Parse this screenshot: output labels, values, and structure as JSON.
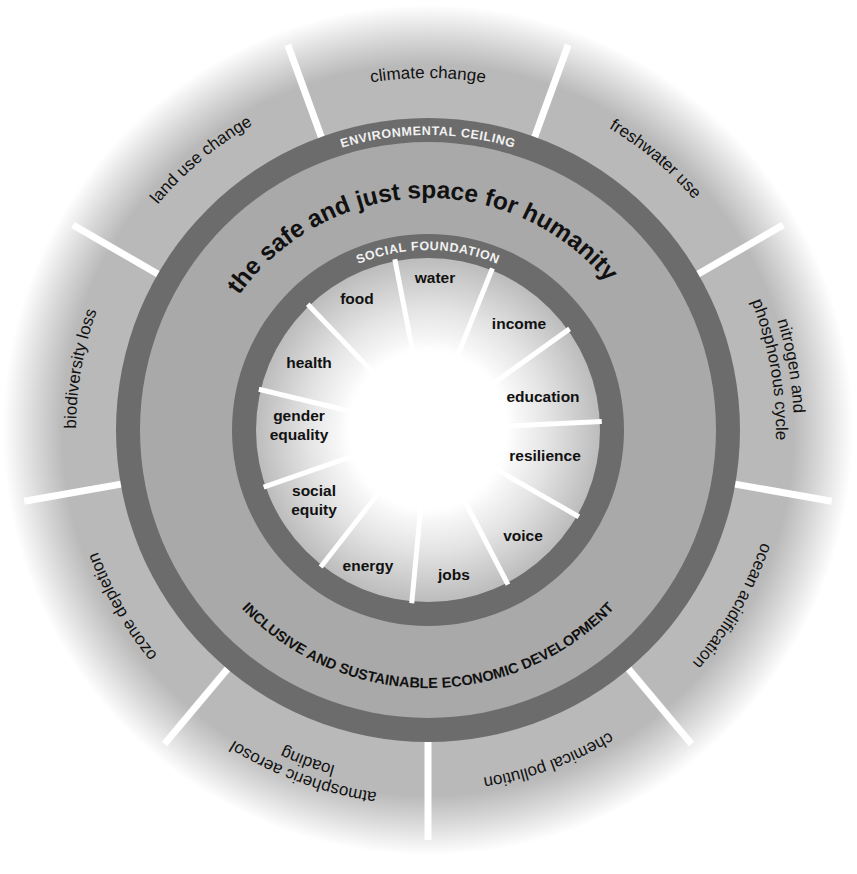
{
  "diagram": {
    "title": "the safe and just space for humanity",
    "environmental_ceiling_label": "ENVIRONMENTAL CEILING",
    "social_foundation_label": "SOCIAL FOUNDATION",
    "economic_label": "INCLUSIVE AND SUSTAINABLE ECONOMIC DEVELOPMENT",
    "colors": {
      "background": "#ffffff",
      "outer_wedge": "#b9b9b9",
      "doughnut_fill": "#a9a9a9",
      "ring": "#6c6c6c",
      "inner_wedge": "#bdbdbd",
      "center_glow": "#ffffff",
      "spoke": "#ffffff",
      "text": "#111111",
      "ring_text": "#f2f2f2"
    },
    "environmental_dimensions": [
      {
        "label": [
          "climate change"
        ],
        "angle": 0
      },
      {
        "label": [
          "freshwater use"
        ],
        "angle": 40
      },
      {
        "label": [
          "nitrogen and",
          "phosphorous cycle"
        ],
        "angle": 80
      },
      {
        "label": [
          "ocean acidification"
        ],
        "angle": 120
      },
      {
        "label": [
          "chemical pollution"
        ],
        "angle": 160
      },
      {
        "label": [
          "atmospheric aerosol",
          "loading"
        ],
        "angle": 200
      },
      {
        "label": [
          "ozone depletion"
        ],
        "angle": 240
      },
      {
        "label": [
          "biodiversity loss"
        ],
        "angle": 280
      },
      {
        "label": [
          "land use change"
        ],
        "angle": 320
      }
    ],
    "social_dimensions": [
      {
        "label": [
          "water"
        ],
        "x": 435,
        "y": 283
      },
      {
        "label": [
          "income"
        ],
        "x": 519,
        "y": 329
      },
      {
        "label": [
          "education"
        ],
        "x": 543,
        "y": 402
      },
      {
        "label": [
          "resilience"
        ],
        "x": 545,
        "y": 461
      },
      {
        "label": [
          "voice"
        ],
        "x": 523,
        "y": 541
      },
      {
        "label": [
          "jobs"
        ],
        "x": 454,
        "y": 580
      },
      {
        "label": [
          "energy"
        ],
        "x": 368,
        "y": 571
      },
      {
        "label": [
          "social",
          "equity"
        ],
        "x": 314,
        "y": 505
      },
      {
        "label": [
          "gender",
          "equality"
        ],
        "x": 299,
        "y": 430
      },
      {
        "label": [
          "health"
        ],
        "x": 309,
        "y": 368
      },
      {
        "label": [
          "food"
        ],
        "x": 357,
        "y": 304
      }
    ]
  }
}
